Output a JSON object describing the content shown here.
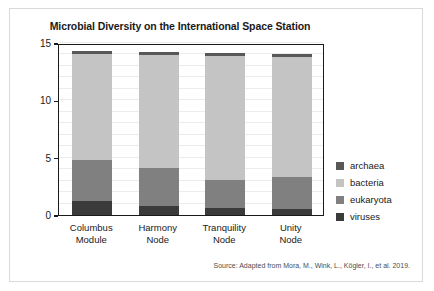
{
  "chart_data": {
    "type": "bar",
    "stacked": true,
    "title": "Microbial Diversity on the International Space Station",
    "xlabel": "",
    "ylabel": "Relative Abundance",
    "ylim": [
      0,
      15
    ],
    "yticks": [
      0,
      5,
      10,
      15
    ],
    "ytick_labels": [
      "0",
      "5",
      "10",
      "15"
    ],
    "grid": true,
    "grid_interval": 1,
    "legend_position": "right",
    "categories": [
      "Columbus Module",
      "Harmony Node",
      "Tranquility Node",
      "Unity Node"
    ],
    "category_lines": [
      [
        "Columbus",
        "Module"
      ],
      [
        "Harmony",
        "Node"
      ],
      [
        "Tranquility",
        "Node"
      ],
      [
        "Unity",
        "Node"
      ]
    ],
    "series": [
      {
        "name": "viruses",
        "color": "#3b3b3b",
        "values": [
          1.2,
          0.8,
          0.65,
          0.5
        ]
      },
      {
        "name": "eukaryota",
        "color": "#808080",
        "values": [
          3.6,
          3.3,
          2.4,
          2.85
        ]
      },
      {
        "name": "bacteria",
        "color": "#c4c4c4",
        "values": [
          9.25,
          9.85,
          10.8,
          10.4
        ]
      },
      {
        "name": "archaea",
        "color": "#585858",
        "values": [
          0.25,
          0.25,
          0.25,
          0.25
        ]
      }
    ],
    "totals": [
      14.3,
      14.2,
      14.1,
      14.0
    ],
    "legend_entries": [
      "archaea",
      "bacteria",
      "eukaryota",
      "viruses"
    ],
    "legend_colors": [
      "#585858",
      "#c4c4c4",
      "#808080",
      "#3b3b3b"
    ],
    "source": "Source: Adapted from Mora, M., Wink, L., Kögler, I., et al. 2019."
  }
}
